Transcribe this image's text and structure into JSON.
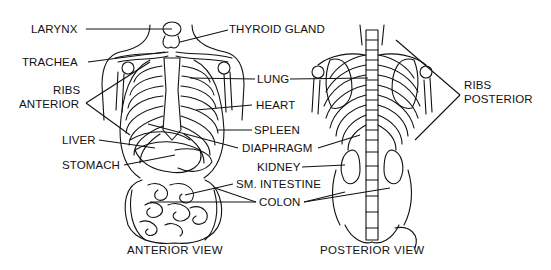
{
  "diagram": {
    "colors": {
      "ink": "#111111",
      "background": "#ffffff"
    },
    "views": [
      {
        "id": "anterior",
        "caption": "ANTERIOR VIEW"
      },
      {
        "id": "posterior",
        "caption": "POSTERIOR VIEW"
      }
    ],
    "labels": {
      "larynx": "LARYNX",
      "thyroid_gland": "THYROID GLAND",
      "trachea": "TRACHEA",
      "ribs_anterior_1": "RIBS",
      "ribs_anterior_2": "ANTERIOR",
      "lung": "LUNG",
      "heart": "HEART",
      "liver": "LIVER",
      "spleen": "SPLEEN",
      "diaphragm": "DIAPHRAGM",
      "stomach": "STOMACH",
      "kidney": "KIDNEY",
      "sm_intestine": "SM. INTESTINE",
      "colon": "COLON",
      "ribs_posterior_1": "RIBS",
      "ribs_posterior_2": "POSTERIOR"
    }
  }
}
